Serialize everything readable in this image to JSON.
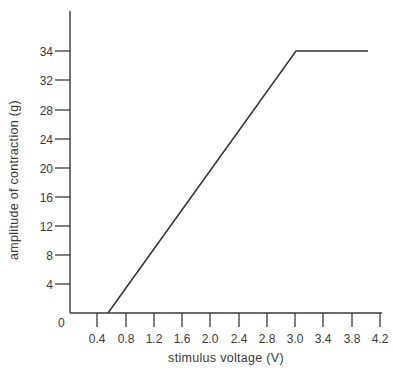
{
  "chart_data": {
    "type": "line",
    "title": "",
    "xlabel": "stimulus voltage (V)",
    "ylabel": "amplitude of contraction (g)",
    "x_tick_labels": [
      "0.4",
      "0.8",
      "1.2",
      "1.6",
      "2.0",
      "2.4",
      "2.8",
      "3.0",
      "3.4",
      "3.8",
      "4.2"
    ],
    "y_tick_labels": [
      "4",
      "8",
      "12",
      "16",
      "20",
      "24",
      "28",
      "32",
      "34"
    ],
    "origin_label": "0",
    "xlim": [
      0,
      4.2
    ],
    "ylim": [
      0,
      34
    ],
    "grid": false,
    "legend": null,
    "series": [
      {
        "name": "contraction amplitude",
        "color": "#333333",
        "x": [
          0.55,
          3.0,
          4.0
        ],
        "y": [
          0,
          34,
          34
        ]
      }
    ]
  },
  "layout": {
    "plot": {
      "x0": 70,
      "y0": 313,
      "y_top": 11,
      "x_end": 382
    },
    "x_ticks_px": [
      97,
      126,
      154,
      182,
      210,
      239,
      267,
      295,
      323,
      352,
      380
    ],
    "y_ticks_px": [
      284,
      255,
      226,
      197,
      168,
      139,
      110,
      80,
      51
    ],
    "line_px": [
      [
        108,
        313
      ],
      [
        296,
        51
      ],
      [
        368,
        51
      ]
    ]
  }
}
